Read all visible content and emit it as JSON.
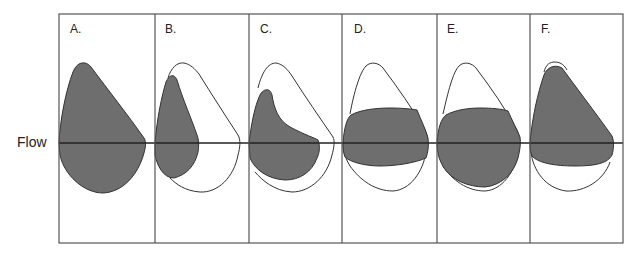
{
  "figure": {
    "axis_label": "Flow",
    "colors": {
      "fill": "#6e6e6e",
      "stroke": "#333333",
      "frame": "#555555"
    },
    "panels": [
      {
        "id": "A",
        "label": "A.",
        "description": "Full filled loop only"
      },
      {
        "id": "B",
        "label": "B.",
        "description": "Narrow filled loop within larger reference outline"
      },
      {
        "id": "C",
        "label": "C.",
        "description": "Filled loop with concave upper limb within reference outline"
      },
      {
        "id": "D",
        "label": "D.",
        "description": "Truncated (flattened) filled loop, top and bottom cut off within outline"
      },
      {
        "id": "E",
        "label": "E.",
        "description": "Top-truncated filled loop, bottom near outline"
      },
      {
        "id": "F",
        "label": "F.",
        "description": "Filled loop matching outline top, bottom truncated"
      }
    ]
  }
}
